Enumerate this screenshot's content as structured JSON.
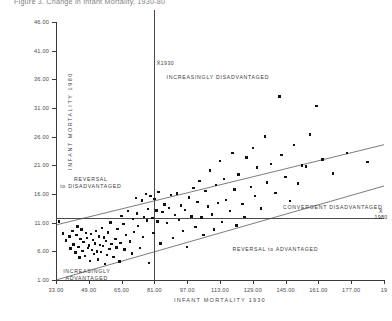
{
  "title": "Figure 3.  Change in Infant Mortality, 1930-80",
  "chart_data": {
    "type": "scatter",
    "title": "Figure 3.  Change in Infant Mortality, 1930-80",
    "xlabel": "INFANT MORTALITY 1930",
    "ylabel": "INFANT MORTALITY 1980",
    "xlim": [
      33.0,
      193.0
    ],
    "ylim": [
      1.0,
      46.0
    ],
    "grid": false,
    "legend": "none",
    "xticks": [
      "33.00",
      "49.00",
      "65.00",
      "81.00",
      "97.00",
      "113.00",
      "129.00",
      "145.00",
      "161.00",
      "177.00",
      "19"
    ],
    "xtick_values": [
      33,
      49,
      65,
      81,
      97,
      113,
      129,
      145,
      161,
      177,
      193
    ],
    "yticks": [
      "46.00",
      "41.00",
      "36.00",
      "31.00",
      "26.00",
      "21.00",
      "16.00",
      "11.00",
      "6.00",
      "1.00"
    ],
    "ytick_values": [
      46,
      41,
      36,
      31,
      26,
      21,
      16,
      11,
      6,
      1
    ],
    "reference_lines": [
      {
        "name": "mean-1930-vertical",
        "orientation": "vertical",
        "x": 81,
        "label": "X̄ 1930"
      },
      {
        "name": "mean-1980-horizontal",
        "orientation": "horizontal",
        "y": 11.8,
        "label": "X̄ 1980"
      },
      {
        "name": "upper-band",
        "orientation": "diagonal",
        "p1": [
          33,
          10.6
        ],
        "p2": [
          193,
          24.6
        ]
      },
      {
        "name": "lower-band",
        "orientation": "diagonal",
        "p1": [
          33,
          1.0
        ],
        "p2": [
          193,
          17.4
        ]
      }
    ],
    "region_labels": [
      {
        "text": "INCREASINGLY DISADVANTAGED",
        "x": 112,
        "y": 36.2
      },
      {
        "text": "REVERSAL\nto DISADVANTAGED",
        "x": 50,
        "y": 18.5
      },
      {
        "text": "CONVERGENT DISADVANTAGED",
        "x": 168,
        "y": 13.6
      },
      {
        "text": "REVERSAL to ADVANTAGED",
        "x": 140,
        "y": 6.2
      },
      {
        "text": "INCREASINGLY\nADVANTAGED",
        "x": 48,
        "y": 2.4
      }
    ],
    "mean_markers": [
      {
        "label_symbol": "X̄",
        "label_value": "1930",
        "axis": "x",
        "value": 81
      },
      {
        "label_symbol": "X̄",
        "label_value": "1980",
        "axis": "y",
        "value": 11.8
      }
    ],
    "points": [
      [
        34.5,
        11.2
      ],
      [
        36.5,
        9.1
      ],
      [
        38.0,
        7.9
      ],
      [
        39.5,
        8.6
      ],
      [
        40.0,
        6.5
      ],
      [
        41.0,
        9.6
      ],
      [
        41.5,
        7.2
      ],
      [
        42.5,
        5.8
      ],
      [
        43.0,
        8.9
      ],
      [
        43.5,
        10.3
      ],
      [
        44.0,
        6.8
      ],
      [
        44.5,
        4.9
      ],
      [
        45.0,
        8.1
      ],
      [
        45.5,
        9.8
      ],
      [
        46.0,
        6.1
      ],
      [
        46.5,
        7.6
      ],
      [
        47.0,
        5.2
      ],
      [
        47.5,
        9.2
      ],
      [
        48.0,
        8.3
      ],
      [
        48.5,
        6.6
      ],
      [
        49.0,
        7.0
      ],
      [
        49.5,
        4.3
      ],
      [
        50.0,
        9.0
      ],
      [
        50.5,
        6.2
      ],
      [
        51.0,
        8.0
      ],
      [
        51.5,
        5.5
      ],
      [
        52.0,
        7.4
      ],
      [
        52.5,
        9.5
      ],
      [
        53.0,
        6.0
      ],
      [
        53.5,
        4.6
      ],
      [
        54.0,
        8.6
      ],
      [
        54.5,
        7.1
      ],
      [
        55.0,
        5.9
      ],
      [
        55.5,
        10.1
      ],
      [
        56.0,
        6.9
      ],
      [
        56.5,
        8.4
      ],
      [
        57.0,
        3.8
      ],
      [
        57.5,
        7.8
      ],
      [
        58.0,
        5.4
      ],
      [
        58.5,
        9.3
      ],
      [
        59.0,
        6.4
      ],
      [
        59.5,
        11.0
      ],
      [
        60.0,
        7.3
      ],
      [
        61.0,
        5.0
      ],
      [
        62.0,
        8.2
      ],
      [
        62.5,
        6.7
      ],
      [
        63.0,
        9.9
      ],
      [
        64.0,
        4.2
      ],
      [
        64.5,
        7.5
      ],
      [
        65.0,
        12.2
      ],
      [
        66.0,
        10.8
      ],
      [
        66.5,
        6.3
      ],
      [
        67.0,
        8.8
      ],
      [
        68.0,
        13.0
      ],
      [
        69.0,
        7.7
      ],
      [
        70.0,
        5.6
      ],
      [
        70.5,
        11.6
      ],
      [
        71.0,
        9.4
      ],
      [
        72.0,
        15.3
      ],
      [
        72.5,
        12.6
      ],
      [
        73.0,
        10.4
      ],
      [
        74.0,
        6.6
      ],
      [
        75.0,
        14.9
      ],
      [
        75.5,
        8.5
      ],
      [
        76.0,
        12.0
      ],
      [
        77.0,
        16.0
      ],
      [
        77.5,
        11.4
      ],
      [
        78.0,
        13.4
      ],
      [
        78.5,
        4.0
      ],
      [
        79.0,
        15.6
      ],
      [
        80.0,
        11.8
      ],
      [
        80.5,
        9.2
      ],
      [
        81.0,
        15.1
      ],
      [
        82.0,
        13.1
      ],
      [
        82.5,
        11.2
      ],
      [
        83.0,
        16.3
      ],
      [
        84.0,
        7.4
      ],
      [
        85.0,
        12.9
      ],
      [
        86.0,
        14.2
      ],
      [
        87.0,
        10.9
      ],
      [
        88.0,
        13.6
      ],
      [
        89.0,
        15.8
      ],
      [
        90.0,
        8.3
      ],
      [
        91.0,
        12.3
      ],
      [
        92.0,
        16.1
      ],
      [
        93.0,
        11.5
      ],
      [
        94.0,
        14.0
      ],
      [
        95.0,
        9.6
      ],
      [
        96.0,
        13.2
      ],
      [
        97.0,
        6.8
      ],
      [
        98.0,
        15.4
      ],
      [
        99.0,
        12.1
      ],
      [
        100.0,
        17.0
      ],
      [
        101.0,
        10.2
      ],
      [
        102.0,
        14.6
      ],
      [
        103.0,
        18.3
      ],
      [
        104.0,
        11.9
      ],
      [
        105.0,
        8.9
      ],
      [
        106.0,
        16.5
      ],
      [
        107.0,
        13.8
      ],
      [
        108.0,
        20.1
      ],
      [
        109.0,
        12.4
      ],
      [
        110.0,
        9.8
      ],
      [
        111.0,
        17.6
      ],
      [
        112.0,
        14.4
      ],
      [
        113.0,
        21.8
      ],
      [
        114.0,
        11.1
      ],
      [
        115.0,
        18.6
      ],
      [
        116.0,
        15.0
      ],
      [
        118.0,
        13.0
      ],
      [
        119.0,
        23.1
      ],
      [
        120.0,
        16.8
      ],
      [
        121.0,
        10.5
      ],
      [
        122.0,
        19.4
      ],
      [
        124.0,
        14.3
      ],
      [
        125.0,
        12.0
      ],
      [
        126.0,
        22.4
      ],
      [
        128.0,
        17.2
      ],
      [
        129.0,
        24.0
      ],
      [
        130.0,
        15.7
      ],
      [
        131.0,
        20.6
      ],
      [
        133.0,
        13.5
      ],
      [
        135.0,
        26.0
      ],
      [
        136.0,
        18.0
      ],
      [
        138.0,
        21.2
      ],
      [
        140.0,
        16.2
      ],
      [
        142.0,
        33.0
      ],
      [
        143.0,
        22.8
      ],
      [
        145.0,
        19.0
      ],
      [
        147.0,
        14.8
      ],
      [
        149.0,
        24.5
      ],
      [
        151.0,
        17.8
      ],
      [
        153.0,
        21.0
      ],
      [
        155.0,
        20.8
      ],
      [
        157.0,
        26.4
      ],
      [
        160.0,
        31.4
      ],
      [
        163.0,
        22.0
      ],
      [
        168.0,
        19.6
      ],
      [
        175.0,
        23.2
      ],
      [
        185.0,
        21.6
      ]
    ]
  }
}
